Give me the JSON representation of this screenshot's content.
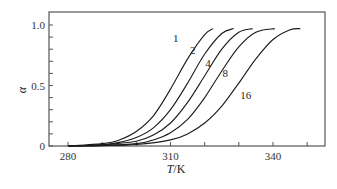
{
  "chart_data": {
    "type": "line",
    "title": "",
    "xlabel": "T/K",
    "ylabel": "α",
    "xlim": [
      275,
      355
    ],
    "ylim": [
      0,
      1.1
    ],
    "grid": false,
    "legend": "inline labels at curves",
    "x_ticks": [
      280,
      290,
      300,
      310,
      320,
      330,
      340,
      350
    ],
    "x_tick_labels": [
      "280",
      "310",
      "340"
    ],
    "y_ticks": [
      0,
      0.1,
      0.2,
      0.3,
      0.4,
      0.5,
      0.6,
      0.7,
      0.8,
      0.9,
      1.0
    ],
    "y_tick_labels": [
      "0",
      "0.5",
      "1.0"
    ],
    "series": [
      {
        "name": "1",
        "label_pos": [
          311.5,
          0.89
        ],
        "x": [
          280,
          290,
          295,
          300,
          305,
          310,
          315,
          320,
          322.5
        ],
        "values": [
          0.0,
          0.02,
          0.05,
          0.12,
          0.25,
          0.47,
          0.72,
          0.92,
          0.97
        ]
      },
      {
        "name": "2",
        "label_pos": [
          316.5,
          0.79
        ],
        "x": [
          280,
          290,
          295,
          300,
          305,
          310,
          315,
          320,
          325,
          328.5
        ],
        "values": [
          0.0,
          0.01,
          0.03,
          0.07,
          0.15,
          0.3,
          0.52,
          0.76,
          0.93,
          0.97
        ]
      },
      {
        "name": "4",
        "label_pos": [
          321,
          0.69
        ],
        "x": [
          280,
          290,
          300,
          305,
          310,
          315,
          320,
          325,
          330,
          334
        ],
        "values": [
          0.0,
          0.01,
          0.04,
          0.09,
          0.19,
          0.36,
          0.58,
          0.8,
          0.94,
          0.97
        ]
      },
      {
        "name": "8",
        "label_pos": [
          326,
          0.6
        ],
        "x": [
          280,
          290,
          300,
          305,
          310,
          315,
          320,
          325,
          330,
          335,
          340.5
        ],
        "values": [
          0.0,
          0.005,
          0.02,
          0.05,
          0.11,
          0.22,
          0.4,
          0.62,
          0.82,
          0.94,
          0.97
        ]
      },
      {
        "name": "16",
        "label_pos": [
          332,
          0.42
        ],
        "x": [
          280,
          290,
          300,
          310,
          315,
          320,
          325,
          330,
          335,
          340,
          345,
          348
        ],
        "values": [
          0.0,
          0.003,
          0.012,
          0.05,
          0.1,
          0.19,
          0.33,
          0.52,
          0.72,
          0.88,
          0.96,
          0.97
        ]
      }
    ]
  },
  "axes": {
    "x_label_italic": "T",
    "x_label_unit": "/K",
    "y_label": "α"
  },
  "colors": {
    "line": "#1a1a1a",
    "axis": "#555555",
    "background": "#ffffff"
  }
}
